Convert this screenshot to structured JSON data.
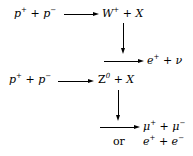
{
  "reaction1": {
    "lhs": {
      "a": "p",
      "a_sup": "+",
      "plus": "+",
      "b": "p",
      "b_sup": "−"
    },
    "rhs": {
      "boson": "W",
      "boson_sup": "+",
      "plus": "+",
      "x": "X"
    },
    "decay": {
      "a": "e",
      "a_sup": "+",
      "plus": "+",
      "b": "ν"
    }
  },
  "reaction2": {
    "lhs": {
      "a": "p",
      "a_sup": "+",
      "plus": "+",
      "b": "p",
      "b_sup": "−"
    },
    "rhs": {
      "boson": "Z",
      "boson_sup": "0",
      "plus": "+",
      "x": "X"
    },
    "decay1": {
      "a": "μ",
      "a_sup": "+",
      "plus": "+",
      "b": "μ",
      "b_sup": "−"
    },
    "or_label": "or",
    "decay2": {
      "a": "e",
      "a_sup": "+",
      "plus": "+",
      "b": "e",
      "b_sup": "−"
    }
  }
}
